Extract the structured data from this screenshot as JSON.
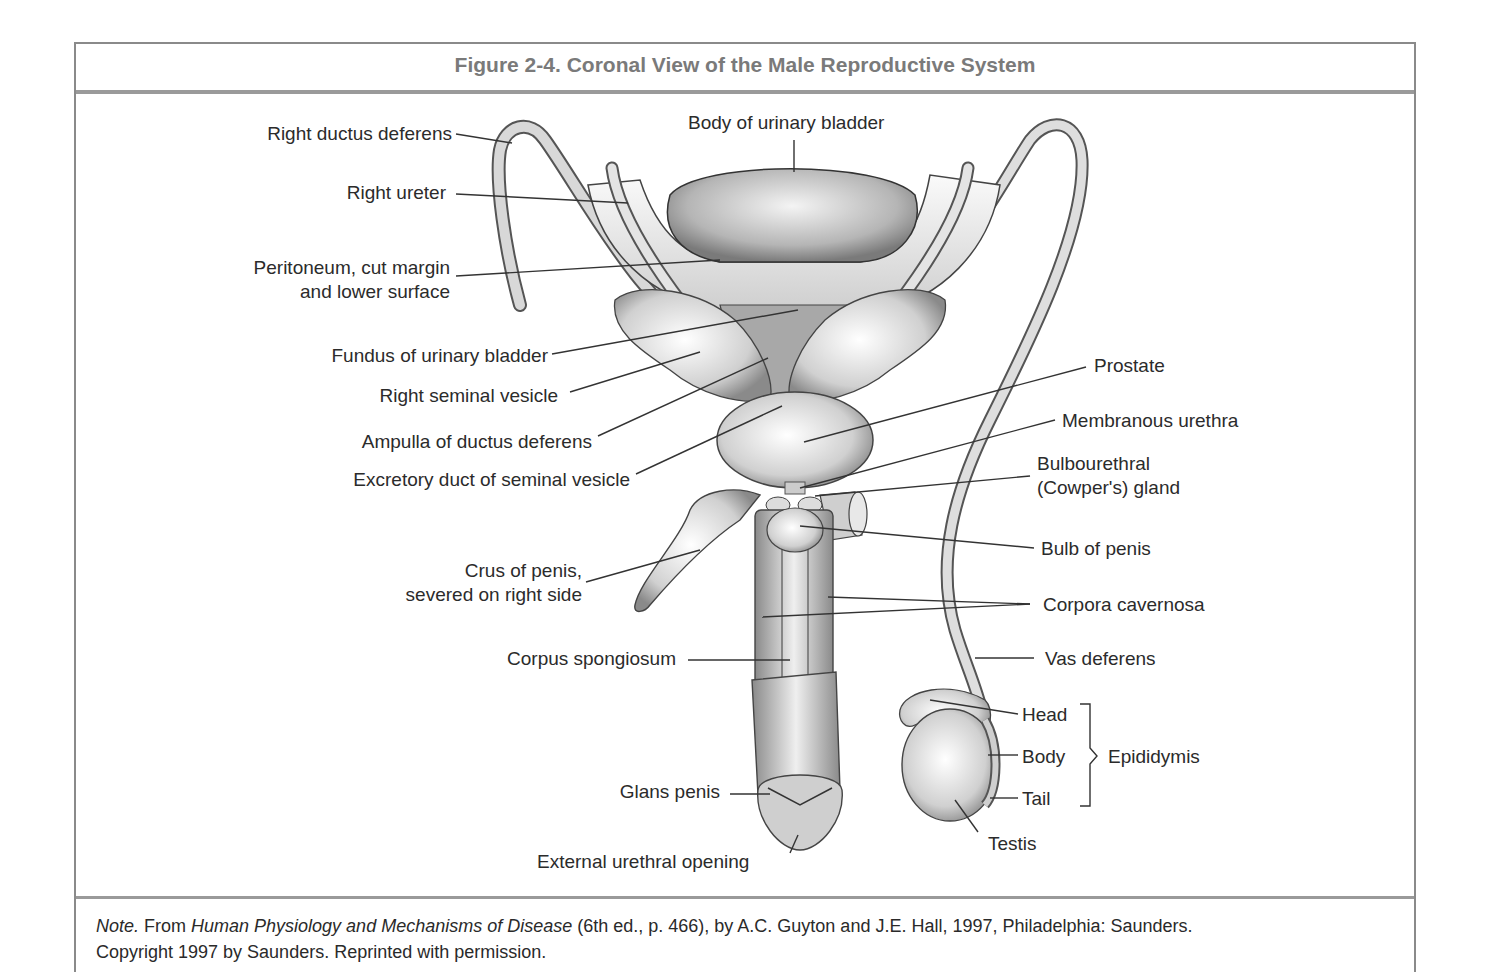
{
  "figure": {
    "title": "Figure 2-4. Coronal View of the Male Reproductive System",
    "colors": {
      "border": "#8a8a8a",
      "title_text": "#7a7a7a",
      "label_text": "#2b2b2b"
    }
  },
  "labels": {
    "right_ductus_deferens": "Right ductus deferens",
    "right_ureter": "Right ureter",
    "peritoneum_line1": "Peritoneum, cut margin",
    "peritoneum_line2": "and lower surface",
    "body_of_urinary_bladder": "Body of urinary bladder",
    "fundus_of_urinary_bladder": "Fundus of urinary bladder",
    "right_seminal_vesicle": "Right seminal vesicle",
    "ampulla_of_ductus_deferens": "Ampulla of ductus deferens",
    "excretory_duct": "Excretory duct of seminal vesicle",
    "prostate": "Prostate",
    "membranous_urethra": "Membranous urethra",
    "bulbourethral_line1": "Bulbourethral",
    "bulbourethral_line2": "(Cowper's) gland",
    "bulb_of_penis": "Bulb of penis",
    "corpora_cavernosa": "Corpora cavernosa",
    "crus_line1": "Crus of penis,",
    "crus_line2": "severed on right side",
    "corpus_spongiosum": "Corpus spongiosum",
    "vas_deferens": "Vas deferens",
    "head": "Head",
    "body": "Body",
    "tail": "Tail",
    "epididymis": "Epididymis",
    "testis": "Testis",
    "glans_penis": "Glans penis",
    "external_urethral_opening": "External urethral opening"
  },
  "note": {
    "prefix": "Note.",
    "from": " From ",
    "book_title": "Human Physiology and Mechanisms of Disease",
    "details": " (6th ed., p. 466), by A.C. Guyton and J.E. Hall, 1997, Philadelphia: Saunders.",
    "line2": "Copyright 1997 by Saunders. Reprinted with permission."
  }
}
